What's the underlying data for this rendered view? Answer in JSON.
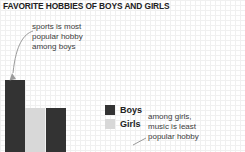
{
  "chart_data": {
    "type": "bar",
    "title": "FAVORITE HOBBIES OF BOYS AND GIRLS",
    "xlabel": "",
    "ylabel": "",
    "grid": true,
    "legend_position": "center-right",
    "categories": [
      "sports",
      "music"
    ],
    "series": [
      {
        "name": "Boys",
        "color": "#333333",
        "values": [
          100,
          58
        ]
      },
      {
        "name": "Girls",
        "color": "#d8d8d8",
        "values": [
          58,
          null
        ]
      }
    ],
    "bars": [
      {
        "category": "sports",
        "series": "Boys",
        "value": 100,
        "color": "#333333",
        "x": 5,
        "width": 20,
        "top": 80
      },
      {
        "category": "sports",
        "series": "Girls",
        "value": 58,
        "color": "#d8d8d8",
        "x": 25,
        "width": 20,
        "top": 108
      },
      {
        "category": "music",
        "series": "Boys",
        "value": 58,
        "color": "#333333",
        "x": 46,
        "width": 20,
        "top": 108
      }
    ],
    "annotations": [
      {
        "id": "sports-note",
        "text": "sports is most\npopular hobby\namong boys"
      },
      {
        "id": "music-note",
        "text": "among girls,\nmusic is least\npopular hobby"
      }
    ]
  },
  "legend": {
    "items": [
      {
        "label": "Boys",
        "color": "#333333"
      },
      {
        "label": "Girls",
        "color": "#d8d8d8"
      }
    ]
  },
  "colors": {
    "boys": "#333333",
    "girls": "#d8d8d8",
    "text": "#3d3d3d",
    "title": "#222222",
    "grid_minor": "#f0f0f0",
    "grid_major": "#e6e6e6",
    "annotation_line": "#9a9a9a",
    "background": "#ffffff"
  }
}
